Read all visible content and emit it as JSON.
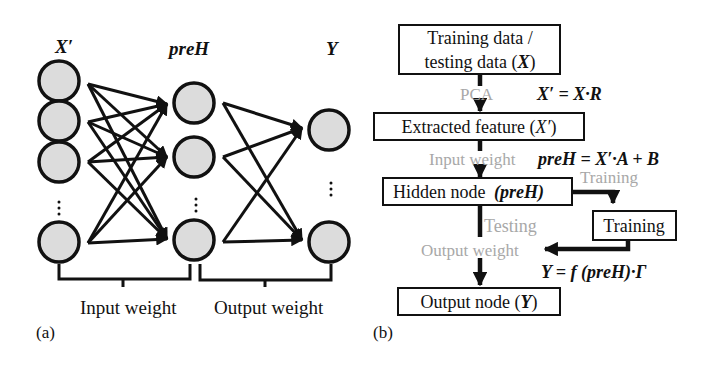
{
  "panel_a": {
    "caption": "(a)",
    "layer_labels": {
      "input": "X′",
      "hidden": "preH",
      "output": "Y"
    },
    "brackets": {
      "left": "Input weight",
      "right": "Output weight"
    },
    "layers": [
      {
        "name": "input",
        "visible_nodes": 4,
        "has_ellipsis": true
      },
      {
        "name": "hidden",
        "visible_nodes": 3,
        "has_ellipsis": true
      },
      {
        "name": "output",
        "visible_nodes": 2,
        "has_ellipsis": true
      }
    ]
  },
  "panel_b": {
    "caption": "(b)",
    "boxes": {
      "training_data_line1": "Training data /",
      "training_data_line2_pre": "testing data (",
      "training_data_line2_var": "X",
      "training_data_line2_post": ")",
      "extracted_pre": "Extracted feature (",
      "extracted_var": "X′",
      "extracted_post": ")",
      "hidden_pre": "Hidden node ",
      "hidden_var": "(preH)",
      "training": "Training",
      "output_pre": "Output node (",
      "output_var": "Y",
      "output_post": ")"
    },
    "step_labels": {
      "pca": "PCA",
      "input_weight": "Input weight",
      "training": "Training",
      "testing": "Testing",
      "output_weight": "Output weight"
    },
    "equations": {
      "pca": "X′ = X·R",
      "input_weight": "preH = X′·A + B",
      "output_weight": "Y = f (preH)·Γ"
    }
  },
  "colors": {
    "line": "#111111",
    "node_fill": "#dcdcdc",
    "muted_text": "#a8a8a8"
  }
}
